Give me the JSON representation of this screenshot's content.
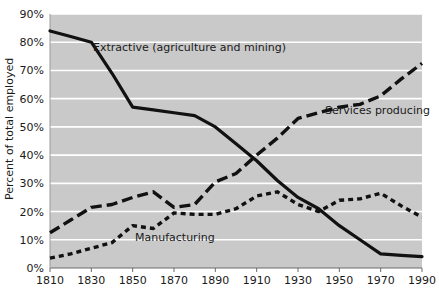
{
  "chart_data": {
    "type": "line",
    "title": "",
    "xlabel": "",
    "ylabel": "Percent of total employed",
    "xlim": [
      1810,
      1990
    ],
    "ylim": [
      0,
      90
    ],
    "grid": true,
    "legend_position": "inline-annotations",
    "plot_background": "#c9c9c9",
    "gridline_color": "#ffffff",
    "line_color": "#111111",
    "x_ticks": [
      1810,
      1830,
      1850,
      1870,
      1890,
      1910,
      1930,
      1950,
      1970,
      1990
    ],
    "x_tick_labels": [
      "1810",
      "1830",
      "1850",
      "1870",
      "1890",
      "1910",
      "1930",
      "1950",
      "1970",
      "1990"
    ],
    "y_ticks": [
      0,
      10,
      20,
      30,
      40,
      50,
      60,
      70,
      80,
      90
    ],
    "y_tick_labels": [
      "0%",
      "10%",
      "20%",
      "30%",
      "40%",
      "50%",
      "60%",
      "70%",
      "80%",
      "90%"
    ],
    "series": [
      {
        "name": "Extractive (agriculture and mining)",
        "style": "solid",
        "annotation": "Extractive (agriculture and mining)",
        "x": [
          1810,
          1820,
          1830,
          1840,
          1850,
          1860,
          1870,
          1880,
          1890,
          1900,
          1910,
          1920,
          1930,
          1940,
          1950,
          1960,
          1970,
          1980,
          1990
        ],
        "values": [
          84,
          82,
          80,
          69,
          57,
          56,
          55,
          54,
          50,
          44,
          38,
          31,
          25,
          21,
          15,
          10,
          5,
          4.5,
          4
        ]
      },
      {
        "name": "Services producing",
        "style": "dashed-long",
        "annotation": "Services producing",
        "x": [
          1810,
          1820,
          1830,
          1840,
          1850,
          1860,
          1870,
          1880,
          1890,
          1900,
          1910,
          1920,
          1930,
          1940,
          1950,
          1960,
          1970,
          1980,
          1990
        ],
        "values": [
          12.5,
          17,
          21.5,
          22.5,
          25,
          27,
          21.5,
          22.5,
          30.5,
          33.5,
          40,
          46,
          53,
          55,
          57,
          58,
          61,
          67,
          72.5
        ]
      },
      {
        "name": "Manufacturing",
        "style": "dashed-short",
        "annotation": "Manufacturing",
        "x": [
          1810,
          1820,
          1830,
          1840,
          1850,
          1860,
          1870,
          1880,
          1890,
          1900,
          1910,
          1920,
          1930,
          1940,
          1950,
          1960,
          1970,
          1980,
          1990
        ],
        "values": [
          3.5,
          5,
          7,
          9,
          15,
          14,
          19.5,
          19,
          19,
          21,
          25.5,
          27,
          22.5,
          20,
          24,
          24.5,
          26.5,
          22,
          18
        ]
      }
    ],
    "annotations": [
      {
        "id": "extractive",
        "text": "Extractive (agriculture and mining)",
        "x_px": 93,
        "y_px": 51
      },
      {
        "id": "services",
        "text": "Services producing",
        "x_px": 325,
        "y_px": 114
      },
      {
        "id": "manufacturing",
        "text": "Manufacturing",
        "x_px": 135,
        "y_px": 241
      }
    ]
  }
}
